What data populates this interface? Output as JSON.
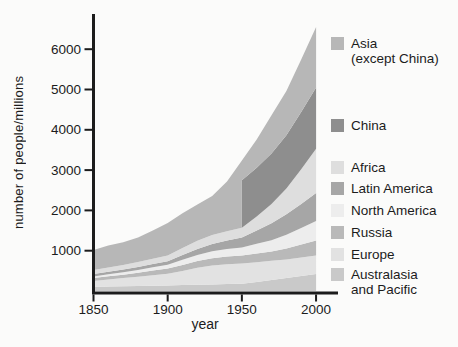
{
  "figure": {
    "background": "#fbfbfa",
    "axis_color": "#1c1c1c"
  },
  "chart_data": {
    "type": "area",
    "stacked": true,
    "title": "",
    "xlabel": "year",
    "ylabel": "number of people/millions",
    "unit": "millions of people",
    "xlim": [
      1850,
      2000
    ],
    "ylim": [
      0,
      6600
    ],
    "x_ticks": [
      1850,
      1900,
      1950,
      2000
    ],
    "y_ticks": [
      1000,
      2000,
      3000,
      4000,
      5000,
      6000
    ],
    "grid": false,
    "legend_position": "right",
    "note": "China shown merged with Asia before 1950; dark China band begins with vertical edge at 1950",
    "x": [
      1850,
      1860,
      1870,
      1880,
      1890,
      1900,
      1910,
      1920,
      1930,
      1940,
      1950,
      1950,
      1960,
      1970,
      1980,
      1990,
      2000
    ],
    "series": [
      {
        "key": "australasia_pacific",
        "label": "Australasia\nand Pacific",
        "color": "#c9c9c9",
        "values": [
          100,
          108,
          116,
          124,
          132,
          140,
          148,
          156,
          164,
          172,
          180,
          180,
          225,
          275,
          320,
          370,
          420
        ]
      },
      {
        "key": "europe",
        "label": "Europe",
        "color": "#e2e2e2",
        "values": [
          150,
          180,
          205,
          230,
          260,
          290,
          350,
          420,
          470,
          490,
          500,
          500,
          490,
          475,
          465,
          462,
          460
        ]
      },
      {
        "key": "russia",
        "label": "Russia",
        "color": "#b9b9b9",
        "values": [
          70,
          78,
          84,
          98,
          115,
          130,
          150,
          165,
          180,
          192,
          200,
          200,
          215,
          230,
          270,
          320,
          370
        ]
      },
      {
        "key": "north_america",
        "label": "North America",
        "color": "#ededed",
        "values": [
          40,
          48,
          58,
          68,
          80,
          90,
          125,
          150,
          170,
          185,
          200,
          200,
          240,
          280,
          340,
          410,
          490
        ]
      },
      {
        "key": "latin_america",
        "label": "Latin America",
        "color": "#a6a6a6",
        "values": [
          60,
          64,
          68,
          75,
          82,
          90,
          120,
          150,
          185,
          215,
          250,
          250,
          330,
          420,
          510,
          600,
          690
        ]
      },
      {
        "key": "africa",
        "label": "Africa",
        "color": "#dedede",
        "values": [
          100,
          108,
          115,
          123,
          131,
          140,
          175,
          205,
          218,
          230,
          240,
          240,
          350,
          480,
          640,
          860,
          1100
        ]
      },
      {
        "key": "china",
        "label": "China",
        "color": "#8e8e8e",
        "values": [
          0,
          0,
          0,
          0,
          0,
          0,
          0,
          0,
          0,
          0,
          0,
          1180,
          1210,
          1250,
          1320,
          1420,
          1520
        ]
      },
      {
        "key": "asia_except_china",
        "label": "Asia\n(except China)",
        "color": "#b7b7b7",
        "values": [
          500,
          540,
          565,
          610,
          700,
          810,
          860,
          900,
          970,
          1230,
          1670,
          490,
          700,
          950,
          1100,
          1300,
          1500
        ]
      }
    ]
  }
}
